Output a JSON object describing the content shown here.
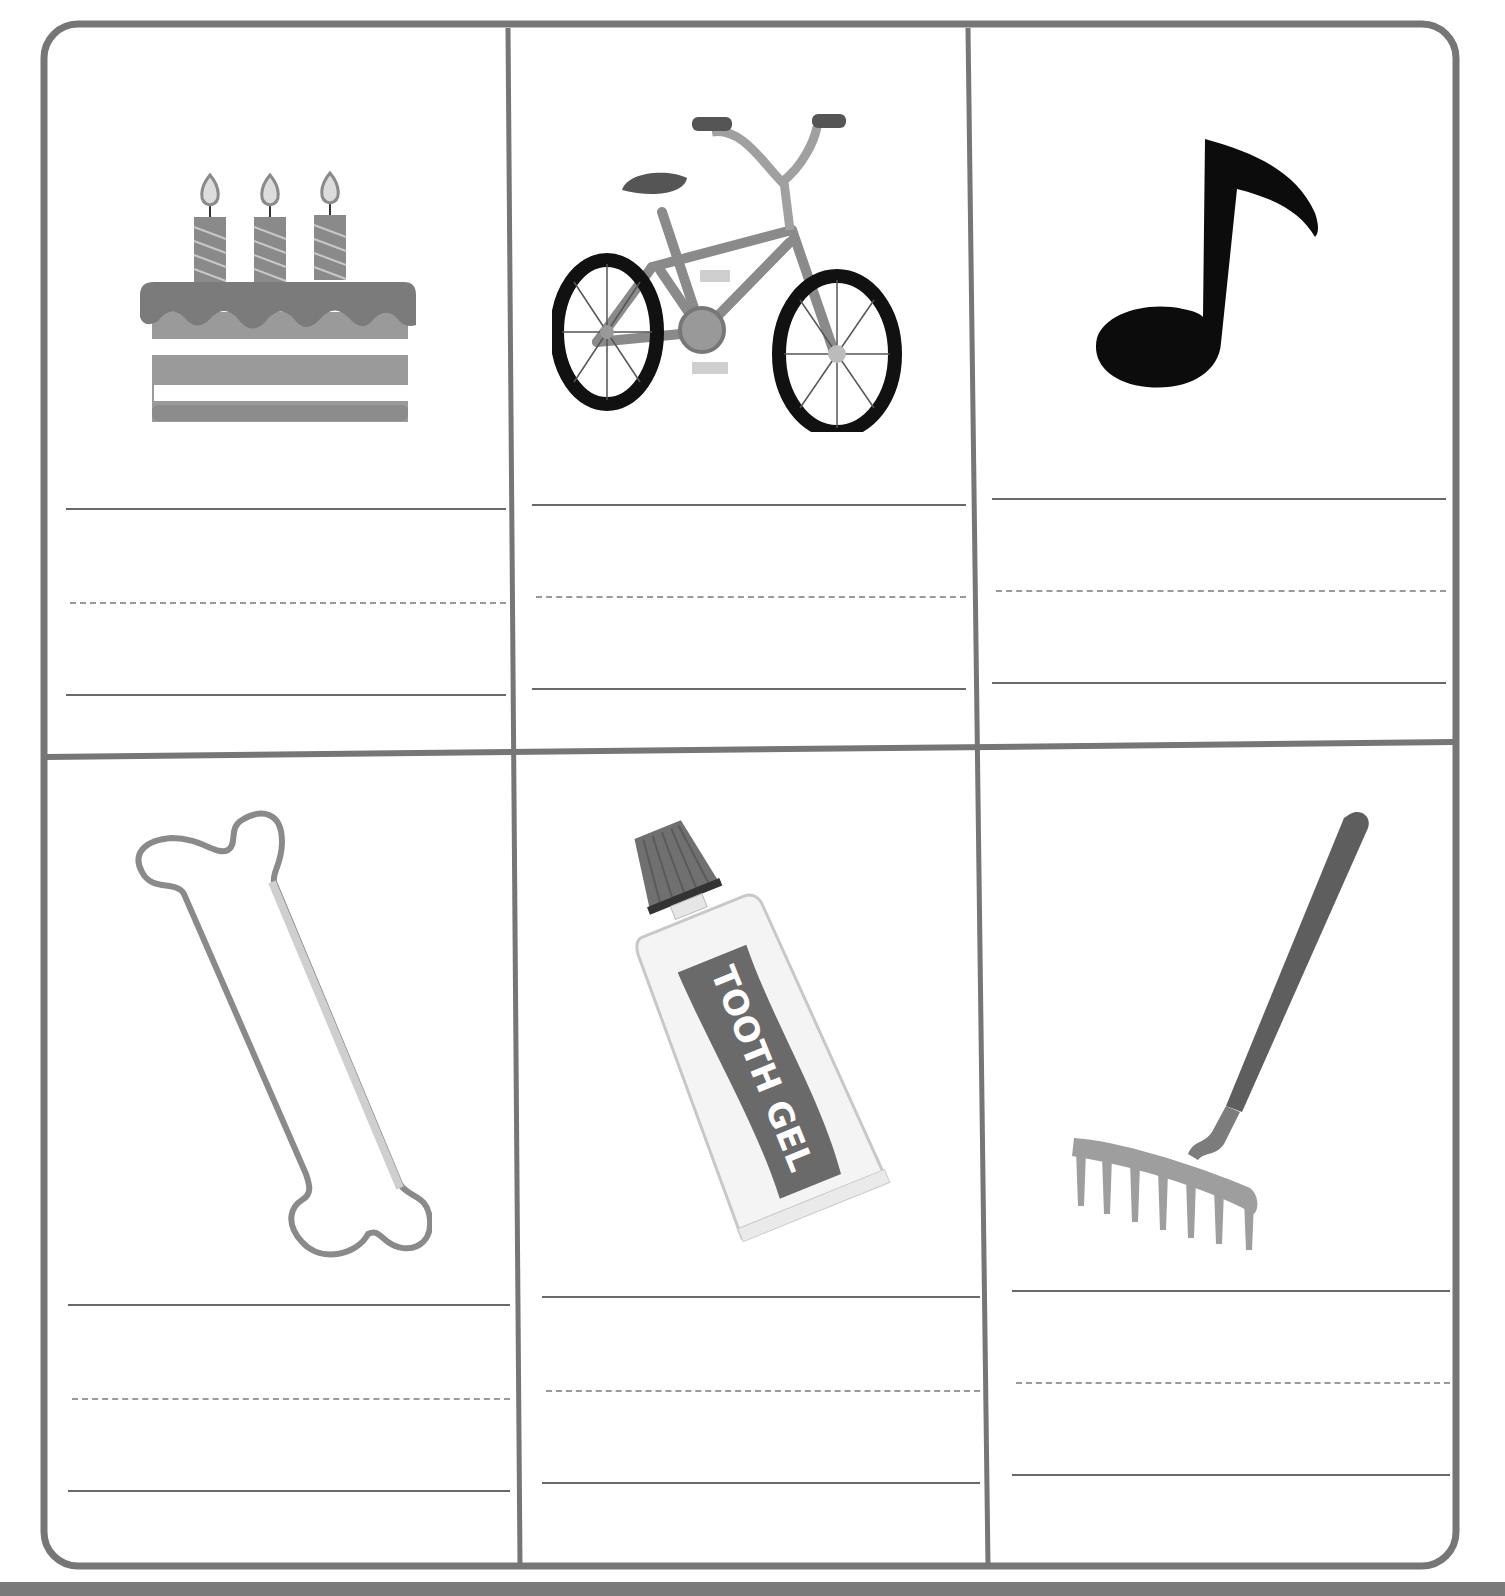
{
  "worksheet": {
    "colors": {
      "frame": "#767676",
      "rule_solid": "#6a6a6a",
      "rule_dashed": "#9a9a9a",
      "background": "#ffffff"
    },
    "rows": [
      {
        "cells": [
          {
            "picture": "birthday-cake",
            "icon": "cake-icon",
            "answer": ""
          },
          {
            "picture": "bicycle",
            "icon": "bicycle-icon",
            "answer": ""
          },
          {
            "picture": "music-note",
            "icon": "music-note-icon",
            "answer": ""
          }
        ]
      },
      {
        "cells": [
          {
            "picture": "bone",
            "icon": "bone-icon",
            "answer": ""
          },
          {
            "picture": "toothpaste-tube",
            "icon": "toothpaste-icon",
            "answer": "",
            "label": "TOOTH GEL"
          },
          {
            "picture": "rake",
            "icon": "rake-icon",
            "answer": ""
          }
        ]
      }
    ]
  }
}
